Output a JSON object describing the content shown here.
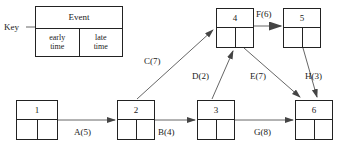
{
  "diagram": {
    "title_label": "Key",
    "key": {
      "header": "Event",
      "early_line1": "early",
      "early_line2": "time",
      "late_line1": "late",
      "late_line2": "time"
    },
    "nodes": [
      {
        "id": "1",
        "label": "1",
        "x": 16,
        "y": 100,
        "w": 42,
        "h": 40
      },
      {
        "id": "2",
        "label": "2",
        "x": 117,
        "y": 100,
        "w": 38,
        "h": 40
      },
      {
        "id": "3",
        "label": "3",
        "x": 197,
        "y": 100,
        "w": 38,
        "h": 40
      },
      {
        "id": "4",
        "label": "4",
        "x": 216,
        "y": 8,
        "w": 38,
        "h": 40
      },
      {
        "id": "5",
        "label": "5",
        "x": 283,
        "y": 8,
        "w": 38,
        "h": 40
      },
      {
        "id": "6",
        "label": "6",
        "x": 295,
        "y": 100,
        "w": 38,
        "h": 40
      }
    ],
    "edges": [
      {
        "id": "A",
        "label": "A(5)",
        "from": "1",
        "to": "2",
        "label_x": 74,
        "label_y": 128
      },
      {
        "id": "B",
        "label": "B(4)",
        "from": "2",
        "to": "3",
        "label_x": 158,
        "label_y": 128
      },
      {
        "id": "C",
        "label": "C(7)",
        "from": "2",
        "to": "4",
        "label_x": 144,
        "label_y": 57
      },
      {
        "id": "D",
        "label": "D(2)",
        "from": "3",
        "to": "4",
        "label_x": 192,
        "label_y": 72
      },
      {
        "id": "E",
        "label": "E(7)",
        "from": "4",
        "to": "6",
        "label_x": 250,
        "label_y": 72
      },
      {
        "id": "F",
        "label": "F(6)",
        "from": "4",
        "to": "5",
        "label_x": 256,
        "label_y": 10
      },
      {
        "id": "G",
        "label": "G(8)",
        "from": "3",
        "to": "6",
        "label_x": 254,
        "label_y": 128
      },
      {
        "id": "H",
        "label": "H(3)",
        "from": "5",
        "to": "6",
        "label_x": 305,
        "label_y": 72
      }
    ],
    "colors": {
      "stroke": "#222222",
      "edge_stroke": "#555555",
      "background": "#ffffff"
    }
  }
}
